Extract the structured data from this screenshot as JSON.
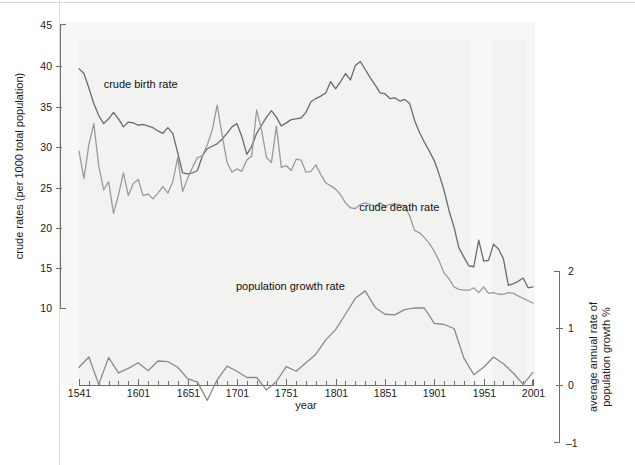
{
  "figure": {
    "background_color": "#ffffff",
    "plot_background_color": "#f2f2f0"
  },
  "chart_data": {
    "type": "line",
    "title": "",
    "subtitle": "",
    "xlabel": "year",
    "ylabel": "crude rates (per 1000 total population)",
    "y2label": "average annual rate of population growth %",
    "xlim": [
      1541,
      2001
    ],
    "ylim": [
      8.5,
      45
    ],
    "y2lim": [
      -1.1,
      2.2
    ],
    "grid": false,
    "legend_position": "inline-annotations",
    "x_tick_labels": [
      "1541",
      "1601",
      "1651",
      "1701",
      "1751",
      "1801",
      "1851",
      "1901",
      "1951",
      "2001"
    ],
    "x_ticks": [
      1541,
      1601,
      1651,
      1701,
      1751,
      1801,
      1851,
      1901,
      1951,
      2001
    ],
    "x_minor_tick_step": 10,
    "y_tick_labels": [
      "10",
      "15",
      "20",
      "25",
      "30",
      "35",
      "40",
      "45"
    ],
    "y_ticks": [
      10,
      15,
      20,
      25,
      30,
      35,
      40,
      45
    ],
    "y2_tick_labels": [
      "–1",
      "0",
      "1",
      "2"
    ],
    "y2_ticks": [
      -1,
      0,
      1,
      2
    ],
    "annotations": [
      {
        "text": "crude birth rate",
        "x": 1566,
        "y": 37.2,
        "name": "crude-birth-rate-label"
      },
      {
        "text": "crude death rate",
        "x": 1825,
        "y": 22.0,
        "name": "crude-death-rate-label"
      },
      {
        "text": "population growth rate",
        "x": 1700,
        "y": 12.2,
        "name": "population-growth-rate-label"
      }
    ],
    "series": [
      {
        "name": "crude birth rate",
        "color": "#6b6b6b",
        "width": 1.3,
        "axis": "left",
        "x": [
          1541,
          1546,
          1551,
          1556,
          1561,
          1566,
          1571,
          1576,
          1581,
          1586,
          1591,
          1596,
          1601,
          1606,
          1611,
          1616,
          1621,
          1626,
          1631,
          1636,
          1641,
          1646,
          1651,
          1656,
          1661,
          1666,
          1671,
          1676,
          1681,
          1686,
          1691,
          1696,
          1701,
          1706,
          1711,
          1716,
          1721,
          1726,
          1731,
          1736,
          1741,
          1746,
          1751,
          1756,
          1761,
          1766,
          1771,
          1776,
          1781,
          1786,
          1791,
          1796,
          1801,
          1806,
          1811,
          1816,
          1821,
          1826,
          1831,
          1836,
          1841,
          1846,
          1851,
          1856,
          1861,
          1866,
          1871,
          1876,
          1881,
          1886,
          1891,
          1896,
          1901,
          1906,
          1911,
          1916,
          1921,
          1926,
          1931,
          1936,
          1941,
          1946,
          1951,
          1956,
          1961,
          1966,
          1971,
          1976,
          1981,
          1986,
          1991,
          1996,
          2001
        ],
        "values": [
          39.6,
          39.0,
          37.2,
          35.3,
          33.8,
          32.8,
          33.4,
          34.2,
          33.4,
          32.4,
          33.0,
          32.9,
          32.6,
          32.7,
          32.5,
          32.3,
          31.9,
          31.6,
          32.3,
          31.6,
          29.2,
          26.7,
          26.6,
          26.7,
          27.0,
          28.8,
          29.7,
          30.0,
          30.3,
          30.9,
          31.6,
          32.4,
          32.8,
          31.2,
          29.0,
          30.0,
          31.6,
          32.6,
          33.6,
          34.4,
          33.6,
          32.5,
          32.9,
          33.3,
          33.4,
          33.5,
          34.2,
          35.5,
          35.9,
          36.2,
          36.6,
          38.0,
          37.1,
          38.0,
          39.0,
          38.2,
          40.0,
          40.5,
          39.5,
          38.5,
          37.6,
          36.6,
          36.5,
          35.9,
          36.0,
          35.6,
          35.8,
          35.3,
          33.2,
          31.7,
          30.5,
          29.4,
          28.2,
          26.5,
          24.5,
          22.0,
          20.0,
          17.4,
          16.3,
          15.2,
          15.1,
          18.4,
          15.8,
          15.9,
          17.9,
          17.3,
          16.1,
          12.8,
          13.0,
          13.3,
          13.7,
          12.5,
          12.6
        ]
      },
      {
        "name": "crude death rate",
        "color": "#9b9b9b",
        "width": 1.3,
        "axis": "left",
        "x": [
          1541,
          1546,
          1551,
          1556,
          1561,
          1566,
          1571,
          1576,
          1581,
          1586,
          1591,
          1596,
          1601,
          1606,
          1611,
          1616,
          1621,
          1626,
          1631,
          1636,
          1641,
          1646,
          1651,
          1656,
          1661,
          1666,
          1671,
          1676,
          1681,
          1686,
          1691,
          1696,
          1701,
          1706,
          1711,
          1716,
          1721,
          1726,
          1731,
          1736,
          1741,
          1746,
          1751,
          1756,
          1761,
          1766,
          1771,
          1776,
          1781,
          1786,
          1791,
          1796,
          1801,
          1806,
          1811,
          1816,
          1821,
          1826,
          1831,
          1836,
          1841,
          1846,
          1851,
          1856,
          1861,
          1866,
          1871,
          1876,
          1881,
          1886,
          1891,
          1896,
          1901,
          1906,
          1911,
          1916,
          1921,
          1926,
          1931,
          1936,
          1941,
          1946,
          1951,
          1956,
          1961,
          1966,
          1971,
          1976,
          1981,
          1986,
          1991,
          1996,
          2001
        ],
        "values": [
          29.4,
          26.0,
          30.2,
          32.8,
          27.6,
          24.6,
          25.6,
          21.7,
          24.0,
          26.7,
          23.9,
          25.4,
          25.9,
          23.9,
          24.1,
          23.5,
          24.2,
          25.0,
          24.2,
          25.6,
          28.6,
          24.4,
          26.0,
          27.4,
          28.6,
          28.8,
          30.2,
          32.0,
          35.1,
          31.4,
          28.0,
          26.8,
          27.2,
          26.9,
          28.3,
          28.8,
          34.5,
          32.0,
          28.6,
          28.0,
          32.5,
          27.4,
          27.6,
          27.0,
          28.4,
          28.3,
          26.8,
          26.9,
          27.7,
          26.5,
          25.5,
          25.1,
          24.7,
          24.0,
          23.0,
          22.4,
          22.3,
          22.8,
          23.0,
          22.8,
          22.6,
          23.0,
          22.6,
          22.8,
          22.8,
          22.8,
          22.6,
          21.4,
          19.6,
          19.3,
          18.7,
          18.0,
          17.0,
          15.8,
          14.3,
          13.6,
          12.6,
          12.3,
          12.2,
          12.2,
          12.5,
          11.9,
          12.6,
          11.8,
          11.9,
          11.7,
          11.7,
          11.9,
          11.8,
          11.5,
          11.2,
          10.9,
          10.6
        ]
      },
      {
        "name": "population growth rate",
        "color": "#8a8a8a",
        "width": 1.3,
        "axis": "right",
        "x": [
          1541,
          1551,
          1561,
          1571,
          1581,
          1591,
          1601,
          1611,
          1621,
          1631,
          1641,
          1651,
          1661,
          1671,
          1681,
          1691,
          1701,
          1711,
          1721,
          1731,
          1741,
          1751,
          1761,
          1771,
          1781,
          1791,
          1801,
          1811,
          1821,
          1831,
          1841,
          1851,
          1861,
          1871,
          1881,
          1891,
          1901,
          1911,
          1921,
          1931,
          1941,
          1951,
          1961,
          1971,
          1981,
          1991,
          2001
        ],
        "values": [
          0.32,
          0.5,
          0.02,
          0.49,
          0.22,
          0.3,
          0.4,
          0.26,
          0.43,
          0.42,
          0.32,
          0.12,
          0.06,
          -0.26,
          0.1,
          0.34,
          0.25,
          0.14,
          0.14,
          -0.08,
          0.07,
          0.33,
          0.25,
          0.4,
          0.55,
          0.8,
          0.98,
          1.25,
          1.53,
          1.66,
          1.37,
          1.25,
          1.24,
          1.33,
          1.36,
          1.36,
          1.09,
          1.07,
          1.0,
          0.48,
          0.19,
          0.32,
          0.5,
          0.38,
          0.22,
          0.02,
          0.23
        ]
      }
    ]
  },
  "axes": {
    "left_title": "crude rates (per 1000 total population)",
    "right_title_line1": "average annual rate of",
    "right_title_line2": "population growth %",
    "x_title": "year"
  }
}
